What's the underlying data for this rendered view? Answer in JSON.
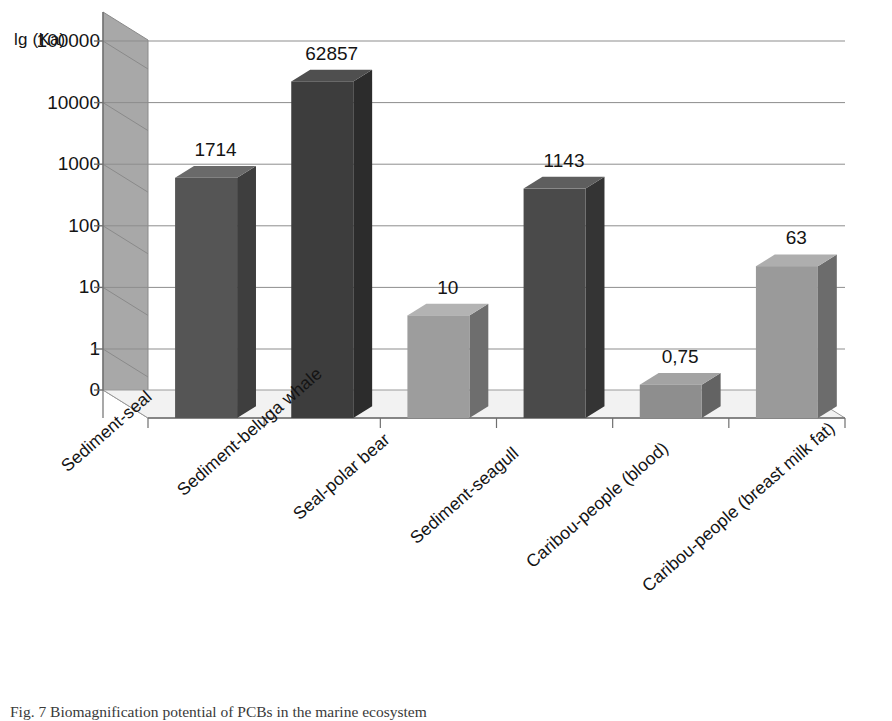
{
  "chart_data": {
    "type": "bar",
    "title": "",
    "subtitle": "",
    "xlabel": "",
    "ylabel": "lg (Ka)",
    "scale": "log",
    "grid": true,
    "legend": "none",
    "style": "3d-column",
    "categories": [
      "Sediment-seal",
      "Sediment-beluga whale",
      "Seal-polar bear",
      "Sediment-seagull",
      "Caribou-people (blood)",
      "Caribou-people (breast milk fat)"
    ],
    "values": [
      1714,
      62857,
      10,
      1143,
      0.75,
      63
    ],
    "value_labels": [
      "1714",
      "62857",
      "10",
      "1143",
      "0,75",
      "63"
    ],
    "ytick_labels": [
      "100000",
      "10000",
      "1000",
      "100",
      "10",
      "1",
      "0"
    ],
    "ytick_values": [
      100000,
      10000,
      1000,
      100,
      10,
      1,
      0
    ],
    "ylim": [
      0,
      100000
    ],
    "bar_colors": [
      "#555555",
      "#3d3d3d",
      "#9d9d9d",
      "#4a4a4a",
      "#8e8e8e",
      "#9a9a9a"
    ],
    "bar_side_colors": [
      "#3e3e3e",
      "#2c2c2c",
      "#6e6e6e",
      "#343434",
      "#636363",
      "#6c6c6c"
    ],
    "bar_top_colors": [
      "#6a6a6a",
      "#4f4f4f",
      "#b3b3b3",
      "#5e5e5e",
      "#a3a3a3",
      "#aeaeae"
    ],
    "wall_color": "#a8a8a8",
    "floor_color": "#f2f2f2",
    "gridline_color": "#8d8d8d",
    "axis_color": "#6f6f6f",
    "text_color": "#141414"
  },
  "caption": {
    "text": "Fig. 7 Biomagnification potential of PCBs in the marine ecosystem"
  }
}
